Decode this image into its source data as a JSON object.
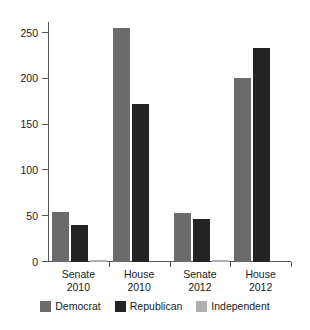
{
  "chart_data": {
    "type": "bar",
    "title": "",
    "subtitle": "",
    "xlabel": "",
    "ylabel": "",
    "categories": [
      "Senate\n2010",
      "House\n2010",
      "Senate\n2012",
      "House\n2012"
    ],
    "category_lines": [
      [
        "Senate",
        "2010"
      ],
      [
        "House",
        "2010"
      ],
      [
        "Senate",
        "2012"
      ],
      [
        "House",
        "2012"
      ]
    ],
    "series": [
      {
        "name": "Democrat",
        "color": "#6b6b6b",
        "values": [
          55,
          255,
          53,
          201
        ]
      },
      {
        "name": "Republican",
        "color": "#232323",
        "values": [
          40,
          173,
          47,
          234
        ]
      },
      {
        "name": "Independent",
        "color": "#b0b0b0",
        "values": [
          2,
          0,
          2,
          0
        ]
      }
    ],
    "ylim": [
      0,
      262
    ],
    "yticks": [
      0,
      50,
      100,
      150,
      200,
      250
    ],
    "ytick_labels": [
      "0",
      "50",
      "100",
      "150",
      "200",
      "250"
    ],
    "grid": false,
    "legend_position": "bottom",
    "orientation": "vertical",
    "grouping": "grouped",
    "background_color": "#ffffff",
    "axis_color": "#555555"
  }
}
